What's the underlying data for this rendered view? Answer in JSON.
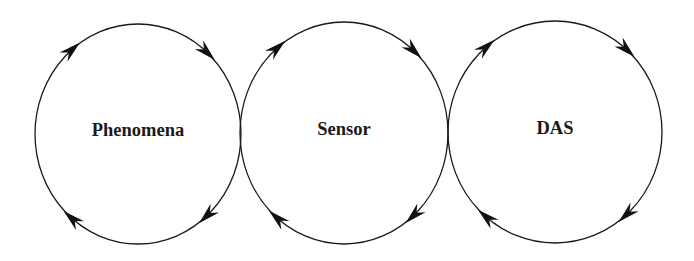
{
  "diagram": {
    "type": "cycle-chain",
    "direction": "clockwise",
    "stroke_color": "#1a1a1a",
    "background": "#ffffff",
    "nodes": [
      {
        "label": "Phenomena",
        "cx": 138,
        "cy": 134,
        "rx": 103,
        "ry": 110
      },
      {
        "label": "Sensor",
        "cx": 344,
        "cy": 133,
        "rx": 104,
        "ry": 111
      },
      {
        "label": "DAS",
        "cx": 555,
        "cy": 132,
        "rx": 107,
        "ry": 111
      }
    ],
    "arrow_angles_deg": [
      -130,
      -48,
      48,
      130
    ]
  }
}
